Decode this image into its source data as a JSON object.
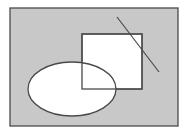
{
  "diagram": {
    "type": "venn",
    "colors": {
      "background": "#ffffff",
      "universal_fill": "#c8c8c8",
      "shape_fill": "#ffffff",
      "stroke": "#4a4a4a"
    },
    "universal_set": {
      "x": 10,
      "y": 8,
      "width": 168,
      "height": 118
    },
    "rectangle": {
      "x": 82,
      "y": 34,
      "width": 60,
      "height": 55
    },
    "ellipse": {
      "cx": 72,
      "cy": 89,
      "rx": 44,
      "ry": 27
    },
    "line": {
      "x1": 117,
      "y1": 17,
      "x2": 159,
      "y2": 72
    }
  }
}
